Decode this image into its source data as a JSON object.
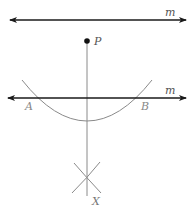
{
  "diagram": {
    "colors": {
      "line": "#1a1a1a",
      "construction": "#8a8a8a",
      "label": "#555555",
      "point": "#111111"
    },
    "elements": {
      "top_line": {
        "label": "m",
        "y": 20,
        "x1": 10,
        "x2": 186
      },
      "point_P": {
        "label": "P",
        "x": 87,
        "y": 41
      },
      "middle_line": {
        "label": "m",
        "y": 98,
        "x1": 8,
        "x2": 186
      },
      "arc": {
        "from": [
          22,
          80
        ],
        "to": [
          152,
          80
        ],
        "bottom": [
          87,
          121
        ]
      },
      "intersection_A": {
        "label": "A",
        "x": 32,
        "y": 98
      },
      "intersection_B": {
        "label": "B",
        "x": 143,
        "y": 98
      },
      "perpendicular": {
        "x": 87,
        "y1": 41,
        "y2": 196
      },
      "crossing_X": {
        "label": "X",
        "x": 87,
        "y": 180
      }
    }
  }
}
